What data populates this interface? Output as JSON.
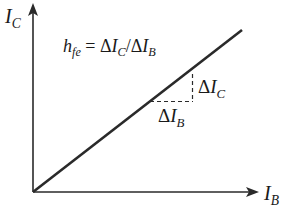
{
  "diagram": {
    "type": "linear transfer characteristic",
    "colors": {
      "stroke": "#2a2a2a",
      "background": "#ffffff"
    },
    "y_axis": {
      "symbol": "I",
      "subscript": "C"
    },
    "x_axis": {
      "symbol": "I",
      "subscript": "B"
    },
    "formula": {
      "lhs_symbol": "h",
      "lhs_subscript": "fe",
      "equals": "=",
      "delta": "Δ",
      "num_symbol": "I",
      "num_subscript": "C",
      "slash": "/",
      "den_symbol": "I",
      "den_subscript": "B"
    },
    "delta_ic": {
      "delta": "Δ",
      "symbol": "I",
      "subscript": "C"
    },
    "delta_ib": {
      "delta": "Δ",
      "symbol": "I",
      "subscript": "B"
    }
  }
}
